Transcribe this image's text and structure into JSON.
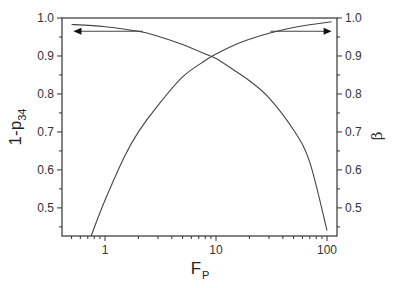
{
  "chart_data": {
    "type": "line",
    "title": "",
    "xlabel": "F_P",
    "xlabel_main": "F",
    "xlabel_sub": "P",
    "x_scale": "log",
    "xlim": [
      0.41,
      123
    ],
    "x_ticks": [
      1,
      10,
      100
    ],
    "x_tick_labels": [
      "1",
      "10",
      "100"
    ],
    "ylabel_left": "1-p_34",
    "ylabel_left_main": "1-p",
    "ylabel_left_sub": "34",
    "ylabel_right": "β",
    "ylim_left": [
      0.426,
      1.0
    ],
    "ylim_right": [
      0.426,
      1.0
    ],
    "y_ticks": [
      0.5,
      0.6,
      0.7,
      0.8,
      0.9,
      1.0
    ],
    "y_tick_labels": [
      "0.5",
      "0.6",
      "0.7",
      "0.8",
      "0.9",
      "1.0"
    ],
    "grid": false,
    "legend": "none",
    "annotations": [
      {
        "type": "arrow",
        "direction": "left",
        "meaning": "1-p_34 curve uses left axis",
        "x_from": 2.2,
        "x_to": 0.52,
        "y": 0.965
      },
      {
        "type": "arrow",
        "direction": "right",
        "meaning": "β curve uses right axis",
        "x_from": 31,
        "x_to": 110,
        "y": 0.965
      }
    ],
    "series": [
      {
        "name": "1-p_34",
        "axis": "left",
        "x": [
          0.5,
          1,
          2,
          3,
          5,
          8,
          10,
          15,
          20,
          30,
          50,
          70,
          100
        ],
        "y": [
          0.983,
          0.977,
          0.965,
          0.952,
          0.93,
          0.905,
          0.893,
          0.86,
          0.835,
          0.79,
          0.705,
          0.62,
          0.44
        ]
      },
      {
        "name": "β",
        "axis": "right",
        "x": [
          0.75,
          1,
          1.5,
          2,
          3,
          5,
          8,
          10,
          15,
          20,
          30,
          50,
          70,
          110
        ],
        "y": [
          0.426,
          0.52,
          0.635,
          0.7,
          0.77,
          0.845,
          0.888,
          0.905,
          0.93,
          0.944,
          0.96,
          0.975,
          0.982,
          0.99
        ]
      }
    ]
  },
  "colors": {
    "line": "#444444",
    "axis": "#333333",
    "background": "#ffffff"
  }
}
